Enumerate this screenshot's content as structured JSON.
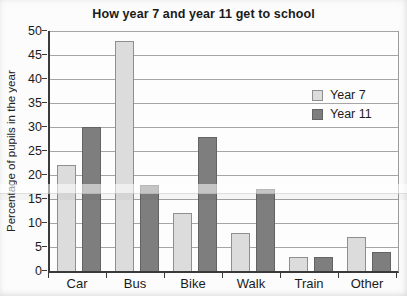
{
  "title": "How year 7 and year 11 get to school",
  "colors": {
    "year7_fill": "#dcdcdc",
    "year7_border": "#8f8f8f",
    "year11_fill": "#7e7e7e",
    "year11_border": "#636363",
    "gridline": "#a5a5a5",
    "axis": "#3a3a3a",
    "text": "#1b1b1b",
    "background": "#fcfcfc"
  },
  "chart_data": {
    "type": "bar",
    "title": "How year 7 and year 11 get to school",
    "categories": [
      "Car",
      "Bus",
      "Bike",
      "Walk",
      "Train",
      "Other"
    ],
    "series": [
      {
        "name": "Year 7",
        "values": [
          22,
          48,
          12,
          8,
          3,
          7
        ]
      },
      {
        "name": "Year 11",
        "values": [
          30,
          18,
          28,
          17,
          3,
          4
        ]
      }
    ],
    "xlabel": "",
    "ylabel": "Percentage of pupils in the year",
    "ylim": [
      0,
      50
    ],
    "ytick_step": 5,
    "ytick_labels": [
      "0",
      "5",
      "10",
      "15",
      "20",
      "25",
      "30",
      "35",
      "40",
      "45",
      "50"
    ],
    "grid": true,
    "legend_position": "inside-right"
  }
}
